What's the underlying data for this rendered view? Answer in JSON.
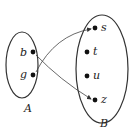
{
  "diagram": {
    "type": "function-mapping",
    "colors": {
      "stroke": "#333333",
      "text": "#222222",
      "background": "#ffffff"
    },
    "sets": [
      {
        "name": "A",
        "elements": [
          "b",
          "g"
        ]
      },
      {
        "name": "B",
        "elements": [
          "s",
          "t",
          "u",
          "z"
        ]
      }
    ],
    "mappings": [
      {
        "from": "b",
        "to": "z"
      },
      {
        "from": "g",
        "to": "s"
      }
    ]
  },
  "labels": {
    "setA": "A",
    "setB": "B",
    "b": "b",
    "g": "g",
    "s": "s",
    "t": "t",
    "u": "u",
    "z": "z"
  }
}
